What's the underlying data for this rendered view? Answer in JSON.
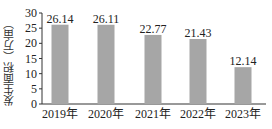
{
  "chart_data": {
    "type": "bar",
    "title": "",
    "xlabel": "",
    "ylabel": "发生面积（万亩）",
    "categories": [
      "2019年",
      "2020年",
      "2021年",
      "2022年",
      "2023年"
    ],
    "values": [
      26.14,
      26.11,
      22.77,
      21.43,
      12.14
    ],
    "value_labels": [
      "26.14",
      "26.11",
      "22.77",
      "21.43",
      "12.14"
    ],
    "ylim": [
      0,
      30
    ],
    "yticks": [
      0,
      5,
      10,
      15,
      20,
      25,
      30
    ],
    "grid": false,
    "legend": null,
    "bar_color": "#a6a6a6"
  }
}
